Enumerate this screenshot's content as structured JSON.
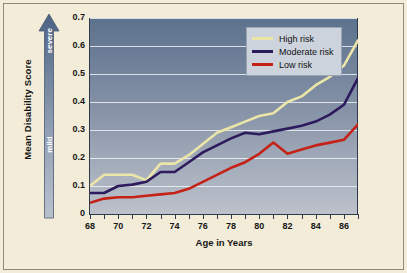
{
  "figure": {
    "background_color": "#f2ecd9",
    "border_color": "#8f8a76"
  },
  "axis_titles": {
    "y": "Mean Disability Score",
    "x": "Age in Years"
  },
  "severity_scale": {
    "top_label": "severe",
    "bottom_label": "mild",
    "arrow_direction": "up"
  },
  "legend": {
    "position": "top-right",
    "entries": [
      {
        "label": "High risk",
        "color": "#ece5a8"
      },
      {
        "label": "Moderate risk",
        "color": "#2d1b5e"
      },
      {
        "label": "Low risk",
        "color": "#c42216"
      }
    ]
  },
  "chart_data": {
    "type": "line",
    "title": "",
    "subtitle": "",
    "xlabel": "Age in Years",
    "ylabel": "Mean Disability Score",
    "xlim": [
      68,
      87
    ],
    "ylim": [
      0,
      0.7
    ],
    "grid": true,
    "legend_position": "top-right",
    "x": [
      68,
      69,
      70,
      71,
      72,
      73,
      74,
      75,
      76,
      77,
      78,
      79,
      80,
      81,
      82,
      83,
      84,
      85,
      86,
      87
    ],
    "xticks": [
      68,
      70,
      72,
      74,
      76,
      78,
      80,
      82,
      84,
      86
    ],
    "xtick_labels": [
      "68",
      "70",
      "72",
      "74",
      "76",
      "78",
      "80",
      "82",
      "84",
      "86"
    ],
    "yticks": [
      0,
      0.1,
      0.2,
      0.3,
      0.4,
      0.5,
      0.6,
      0.7
    ],
    "ytick_labels": [
      "0",
      "0.1",
      "0.2",
      "0.3",
      "0.4",
      "0.5",
      "0.6",
      "0.7"
    ],
    "series": [
      {
        "name": "High risk",
        "color": "#ece5a8",
        "values": [
          0.1,
          0.14,
          0.14,
          0.14,
          0.12,
          0.18,
          0.18,
          0.21,
          0.25,
          0.29,
          0.31,
          0.33,
          0.35,
          0.36,
          0.4,
          0.42,
          0.46,
          0.49,
          0.53,
          0.62
        ]
      },
      {
        "name": "Moderate risk",
        "color": "#2d1b5e",
        "values": [
          0.075,
          0.075,
          0.1,
          0.105,
          0.115,
          0.15,
          0.15,
          0.185,
          0.22,
          0.245,
          0.27,
          0.29,
          0.285,
          0.295,
          0.305,
          0.315,
          0.33,
          0.355,
          0.39,
          0.485
        ]
      },
      {
        "name": "Low risk",
        "color": "#c42216",
        "values": [
          0.04,
          0.055,
          0.06,
          0.06,
          0.065,
          0.07,
          0.075,
          0.09,
          0.115,
          0.14,
          0.165,
          0.185,
          0.215,
          0.255,
          0.215,
          0.23,
          0.245,
          0.255,
          0.265,
          0.32
        ]
      }
    ]
  }
}
